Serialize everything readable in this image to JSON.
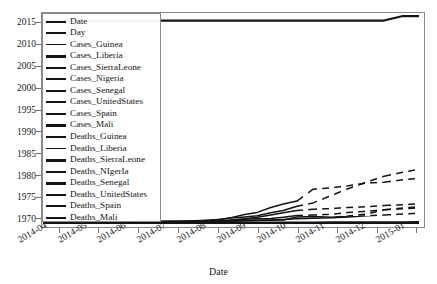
{
  "figure": {
    "background_color": "#ffffff",
    "line_color": "#141414",
    "axis_color": "#8a8a8a",
    "text_color": "#1a1a1a"
  },
  "axes": {
    "x_title": "Date",
    "y_title": "",
    "x_ticks": [
      "2014-04",
      "2014-05",
      "2014-06",
      "2014-07",
      "2014-08",
      "2014-09",
      "2014-10",
      "2014-11",
      "2014-12",
      "2015-01"
    ],
    "y_ticks": [
      "1970",
      "1975",
      "1980",
      "1985",
      "1990",
      "1995",
      "2000",
      "2005",
      "2010",
      "2015"
    ]
  },
  "legend": {
    "entries": [
      {
        "label": "Date"
      },
      {
        "label": "Day"
      },
      {
        "label": "Cases_Guinea"
      },
      {
        "label": "Cases_Liberia"
      },
      {
        "label": "Cases_SierraLeone"
      },
      {
        "label": "Cases_Nigeria"
      },
      {
        "label": "Cases_Senegal"
      },
      {
        "label": "Cases_UnitedStates"
      },
      {
        "label": "Cases_Spain"
      },
      {
        "label": "Cases_Mali"
      },
      {
        "label": "Deaths_Guinea"
      },
      {
        "label": "Deaths_Liberia"
      },
      {
        "label": "Deaths_SierraLeone"
      },
      {
        "label": "Deaths_NIgerIa"
      },
      {
        "label": "Deaths_Senegal"
      },
      {
        "label": "Deaths_UnitedStates"
      },
      {
        "label": "Deaths_Spain"
      },
      {
        "label": "Deaths_Mali"
      }
    ]
  },
  "chart_data": {
    "type": "line",
    "title": "",
    "xlabel": "Date",
    "ylabel": "",
    "grid": false,
    "legend_position": "upper-left",
    "xlim": [
      "2014-03-22",
      "2015-01-18"
    ],
    "ylim": [
      1968.5,
      2016.5
    ],
    "x": [
      "2014-03-22",
      "2014-03-27",
      "2014-04-01",
      "2014-04-07",
      "2014-04-14",
      "2014-04-21",
      "2014-04-30",
      "2014-05-12",
      "2014-05-27",
      "2014-06-10",
      "2014-06-20",
      "2014-07-02",
      "2014-07-14",
      "2014-07-27",
      "2014-08-09",
      "2014-08-20",
      "2014-08-31",
      "2014-09-10",
      "2014-09-21",
      "2014-10-01",
      "2014-10-12",
      "2014-10-25",
      "2014-11-09",
      "2014-11-22",
      "2014-12-07",
      "2014-12-21",
      "2015-01-05",
      "2015-01-18"
    ],
    "series": [
      {
        "name": "Date",
        "values": [
          2014,
          2014,
          2014,
          2014,
          2014,
          2014,
          2014,
          2014,
          2014,
          2014,
          2014,
          2014,
          2014,
          2014,
          2014,
          2014,
          2014,
          2014,
          2014,
          2014,
          2014,
          2014,
          2014,
          2014,
          2014,
          2014,
          2015,
          2015
        ]
      },
      {
        "name": "Day",
        "values": [
          0,
          5,
          10,
          16,
          23,
          30,
          39,
          51,
          66,
          80,
          90,
          102,
          114,
          127,
          140,
          151,
          162,
          172,
          183,
          193,
          204,
          217,
          232,
          245,
          260,
          274,
          289,
          302
        ]
      },
      {
        "name": "Cases_Guinea",
        "values": [
          49,
          86,
          122,
          151,
          197,
          203,
          221,
          248,
          281,
          376,
          390,
          412,
          415,
          460,
          506,
          579,
          771,
          861,
          936,
          1157,
          1472,
          1598,
          1731,
          2047,
          2292,
          2571,
          2775,
          2917
        ]
      },
      {
        "name": "Cases_Liberia",
        "values": [
          0,
          0,
          8,
          21,
          27,
          34,
          35,
          12,
          13,
          33,
          51,
          107,
          174,
          329,
          599,
          1082,
          1698,
          2081,
          3022,
          3696,
          4249,
          6525,
          6822,
          7168,
          7719,
          7862,
          8331,
          8622
        ]
      },
      {
        "name": "Cases_SierraLeone",
        "values": [
          0,
          0,
          0,
          0,
          0,
          0,
          0,
          0,
          16,
          97,
          158,
          252,
          397,
          533,
          730,
          1026,
          1216,
          1424,
          2021,
          2437,
          3252,
          3896,
          5368,
          6599,
          7897,
          9004,
          9780,
          10340
        ]
      },
      {
        "name": "Cases_Nigeria",
        "values": [
          0,
          0,
          0,
          0,
          0,
          0,
          0,
          0,
          0,
          0,
          0,
          1,
          1,
          4,
          13,
          16,
          21,
          21,
          20,
          20,
          20,
          20,
          20,
          20,
          20,
          20,
          20,
          20
        ]
      },
      {
        "name": "Cases_Senegal",
        "values": [
          0,
          0,
          0,
          0,
          0,
          0,
          0,
          0,
          0,
          0,
          0,
          0,
          0,
          0,
          1,
          1,
          1,
          1,
          1,
          1,
          1,
          1,
          1,
          1,
          1,
          1,
          1,
          1
        ]
      },
      {
        "name": "Cases_UnitedStates",
        "values": [
          0,
          0,
          0,
          0,
          0,
          0,
          0,
          0,
          0,
          0,
          0,
          0,
          0,
          0,
          0,
          0,
          0,
          0,
          0,
          1,
          3,
          4,
          4,
          4,
          4,
          4,
          4,
          4
        ]
      },
      {
        "name": "Cases_Spain",
        "values": [
          0,
          0,
          0,
          0,
          0,
          0,
          0,
          0,
          0,
          0,
          0,
          0,
          0,
          0,
          0,
          0,
          0,
          0,
          0,
          1,
          1,
          1,
          1,
          1,
          1,
          1,
          1,
          1
        ]
      },
      {
        "name": "Cases_Mali",
        "values": [
          0,
          0,
          0,
          0,
          0,
          0,
          0,
          0,
          0,
          0,
          0,
          0,
          0,
          0,
          0,
          0,
          0,
          0,
          0,
          0,
          0,
          1,
          6,
          7,
          8,
          8,
          8,
          8
        ]
      },
      {
        "name": "Deaths_Guinea",
        "values": [
          29,
          62,
          80,
          95,
          122,
          129,
          146,
          171,
          186,
          264,
          270,
          305,
          314,
          339,
          373,
          396,
          494,
          557,
          595,
          710,
          843,
          977,
          1041,
          1214,
          1428,
          1586,
          1781,
          1910
        ]
      },
      {
        "name": "Deaths_Liberia",
        "values": [
          0,
          0,
          6,
          10,
          13,
          6,
          9,
          11,
          11,
          24,
          34,
          65,
          106,
          156,
          323,
          624,
          871,
          1137,
          1578,
          1998,
          2458,
          2697,
          2836,
          3016,
          3177,
          3384,
          3538,
          3731
        ]
      },
      {
        "name": "Deaths_SierraLeone",
        "values": [
          0,
          0,
          0,
          0,
          0,
          0,
          0,
          0,
          5,
          49,
          63,
          101,
          160,
          233,
          315,
          422,
          476,
          524,
          605,
          623,
          1183,
          1281,
          1169,
          1398,
          1768,
          2582,
          2943,
          3145
        ]
      },
      {
        "name": "Deaths_NIgerIa",
        "values": [
          0,
          0,
          0,
          0,
          0,
          0,
          0,
          0,
          0,
          0,
          0,
          1,
          1,
          1,
          2,
          5,
          7,
          8,
          8,
          8,
          8,
          8,
          8,
          8,
          8,
          8,
          8,
          8
        ]
      },
      {
        "name": "Deaths_Senegal",
        "values": [
          0,
          0,
          0,
          0,
          0,
          0,
          0,
          0,
          0,
          0,
          0,
          0,
          0,
          0,
          0,
          0,
          0,
          0,
          0,
          0,
          0,
          0,
          0,
          0,
          0,
          0,
          0,
          0
        ]
      },
      {
        "name": "Deaths_UnitedStates",
        "values": [
          0,
          0,
          0,
          0,
          0,
          0,
          0,
          0,
          0,
          0,
          0,
          0,
          0,
          0,
          0,
          0,
          0,
          0,
          0,
          0,
          1,
          1,
          1,
          1,
          1,
          1,
          1,
          1
        ]
      },
      {
        "name": "Deaths_Spain",
        "values": [
          0,
          0,
          0,
          0,
          0,
          0,
          0,
          0,
          0,
          0,
          0,
          0,
          0,
          0,
          0,
          0,
          0,
          0,
          0,
          0,
          0,
          0,
          0,
          0,
          0,
          0,
          0,
          0
        ]
      },
      {
        "name": "Deaths_Mali",
        "values": [
          0,
          0,
          0,
          0,
          0,
          0,
          0,
          0,
          0,
          0,
          0,
          0,
          0,
          0,
          0,
          0,
          0,
          0,
          0,
          0,
          0,
          1,
          6,
          6,
          6,
          6,
          6,
          6
        ]
      }
    ],
    "note": "Date and Day columns plotted on same numeric axis as case/death counts; Date series renders as a flat line near 2014-2015 while all count series are compressed near the axis baseline."
  }
}
